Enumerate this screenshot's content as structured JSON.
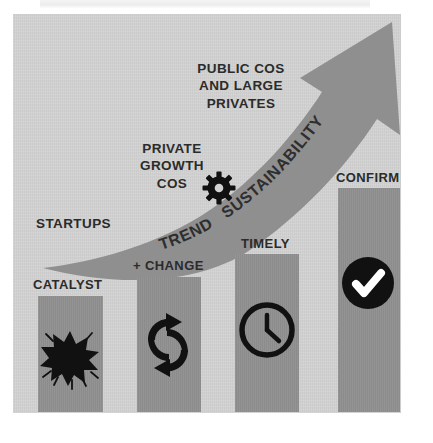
{
  "diagram": {
    "title_visible": false,
    "type": "growth-stage-arrow-diagram",
    "colors": {
      "panel_background": "#d2d2d2",
      "bar_fill": "#909090",
      "arrow_fill": "#8f8f8f",
      "text": "#2b2b2b",
      "icon": "#111111",
      "icon_inner": "#ffffff"
    },
    "arrow": {
      "name": "upward-growth-arrow",
      "direction": "up-right",
      "labels": [
        {
          "text": "TREND",
          "name": "trend-label"
        },
        {
          "text": "SUSTAINABILITY",
          "name": "sustainability-label"
        }
      ],
      "icon": "gear-icon"
    },
    "stage_labels": [
      {
        "id": "startups",
        "text": "STARTUPS",
        "name": "stage-label-startups"
      },
      {
        "id": "private-growth",
        "text": "PRIVATE\nGROWTH\nCOS",
        "lines": [
          "PRIVATE",
          "GROWTH",
          "COS"
        ],
        "name": "stage-label-private-growth-cos"
      },
      {
        "id": "public-large",
        "text": "PUBLIC COS\nAND LARGE\nPRIVATES",
        "lines": [
          "PUBLIC COS",
          "AND LARGE",
          "PRIVATES"
        ],
        "name": "stage-label-public-cos-and-large-privates"
      }
    ],
    "bars": [
      {
        "id": "catalyst",
        "label": "CATALYST",
        "icon": "explosion-burst-icon",
        "height_rank": 1
      },
      {
        "id": "change",
        "label": "+ CHANGE",
        "icon": "refresh-sync-arrows-icon",
        "height_rank": 2
      },
      {
        "id": "timely",
        "label": "TIMELY",
        "icon": "clock-icon",
        "height_rank": 3
      },
      {
        "id": "confirm",
        "label": "CONFIRM",
        "icon": "check-circle-icon",
        "height_rank": 4
      }
    ]
  }
}
